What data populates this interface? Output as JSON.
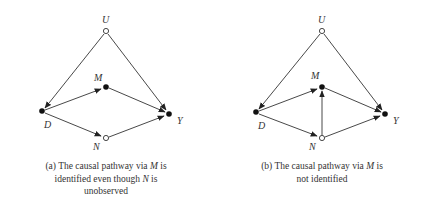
{
  "figure": {
    "panels": [
      {
        "id": "a",
        "nodes": {
          "U": {
            "label": "U",
            "observed": false
          },
          "M": {
            "label": "M",
            "observed": true
          },
          "D": {
            "label": "D",
            "observed": true
          },
          "Y": {
            "label": "Y",
            "observed": true
          },
          "N": {
            "label": "N",
            "observed": false
          }
        },
        "edges": [
          [
            "U",
            "D"
          ],
          [
            "U",
            "Y"
          ],
          [
            "D",
            "M"
          ],
          [
            "M",
            "Y"
          ],
          [
            "D",
            "N"
          ],
          [
            "N",
            "Y"
          ]
        ],
        "caption": {
          "line1": "(a) The causal pathway via ",
          "var1": "M",
          "line1b": " is",
          "line2": "identified even though ",
          "var2": "N",
          "line2b": " is",
          "line3": "unobserved"
        }
      },
      {
        "id": "b",
        "nodes": {
          "U": {
            "label": "U",
            "observed": false
          },
          "M": {
            "label": "M",
            "observed": true
          },
          "D": {
            "label": "D",
            "observed": true
          },
          "Y": {
            "label": "Y",
            "observed": true
          },
          "N": {
            "label": "N",
            "observed": false
          }
        },
        "edges": [
          [
            "U",
            "D"
          ],
          [
            "U",
            "Y"
          ],
          [
            "D",
            "M"
          ],
          [
            "M",
            "Y"
          ],
          [
            "D",
            "N"
          ],
          [
            "N",
            "Y"
          ],
          [
            "N",
            "M"
          ]
        ],
        "caption": {
          "line1": "(b) The causal pathway via ",
          "var1": "M",
          "line1b": " is",
          "line2": "not identified"
        }
      }
    ]
  }
}
